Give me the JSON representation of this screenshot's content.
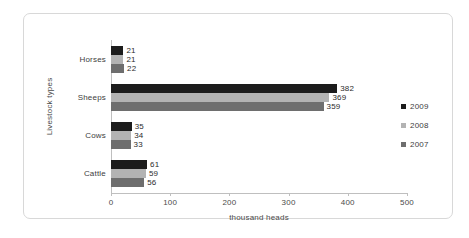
{
  "chart_data": {
    "type": "bar",
    "orientation": "horizontal",
    "title": "",
    "xlabel": "thousand heads",
    "ylabel": "Livestock types",
    "categories": [
      "Cattle",
      "Cows",
      "Sheeps",
      "Horses"
    ],
    "categories_top_to_bottom": [
      "Horses",
      "Sheeps",
      "Cows",
      "Cattle"
    ],
    "series": [
      {
        "name": "2009",
        "color": "#1c1c1c",
        "values": [
          61,
          35,
          382,
          21
        ]
      },
      {
        "name": "2008",
        "color": "#b3b3b3",
        "values": [
          59,
          34,
          369,
          21
        ]
      },
      {
        "name": "2007",
        "color": "#6e6e6e",
        "values": [
          56,
          33,
          359,
          22
        ]
      }
    ],
    "xlim": [
      0,
      500
    ],
    "xticks": [
      0,
      100,
      200,
      300,
      400,
      500
    ],
    "xtick_labels": [
      "0",
      "100",
      "200",
      "300",
      "400",
      "500"
    ],
    "grid": false,
    "legend_position": "right",
    "data_labels": true
  },
  "axes": {
    "x_title": "thousand heads",
    "y_title": "Livestock types",
    "tick_labels": [
      "0",
      "100",
      "200",
      "300",
      "400",
      "500"
    ]
  },
  "categories": [
    {
      "label": "Horses",
      "values": [
        21,
        21,
        22
      ]
    },
    {
      "label": "Sheeps",
      "values": [
        382,
        369,
        359
      ]
    },
    {
      "label": "Cows",
      "values": [
        35,
        34,
        33
      ]
    },
    {
      "label": "Cattle",
      "values": [
        61,
        59,
        56
      ]
    }
  ],
  "legend": {
    "items": [
      {
        "label": "2009",
        "color": "#1c1c1c"
      },
      {
        "label": "2008",
        "color": "#b3b3b3"
      },
      {
        "label": "2007",
        "color": "#6e6e6e"
      }
    ]
  }
}
